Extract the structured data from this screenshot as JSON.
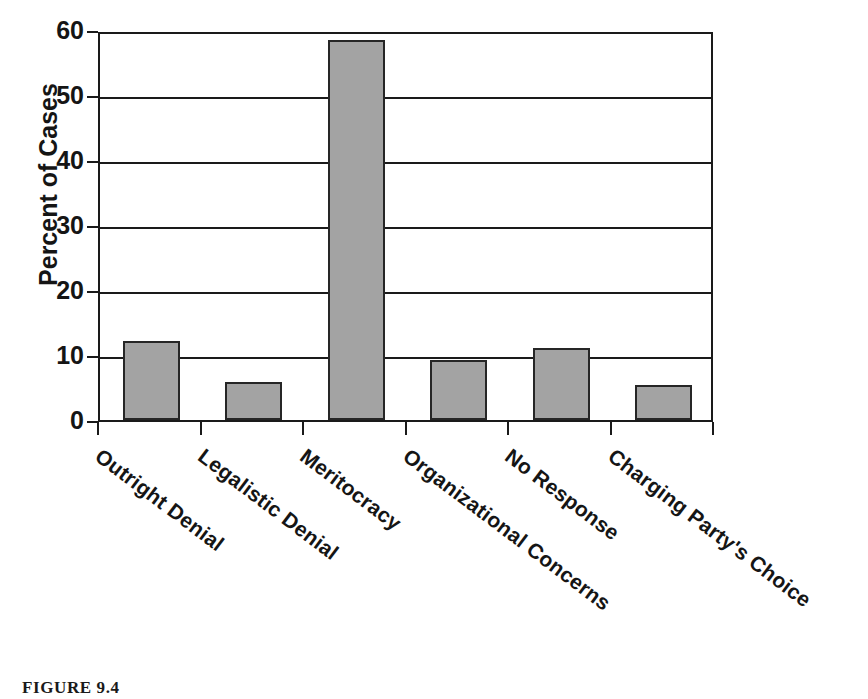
{
  "chart_data": {
    "type": "bar",
    "title": "",
    "xlabel": "",
    "ylabel": "Percent of Cases",
    "ylim": [
      0,
      60
    ],
    "yticks": [
      0,
      10,
      20,
      30,
      40,
      50,
      60
    ],
    "grid": true,
    "legend": "none",
    "categories": [
      "Outright Denial",
      "Legalistic Denial",
      "Meritocracy",
      "Organizational Concerns",
      "No Response",
      "Charging Party's Choice"
    ],
    "values": [
      12.2,
      5.9,
      58.5,
      9.3,
      11.1,
      5.4
    ],
    "bar_color": "#a3a3a3",
    "bar_edge_color": "#262626"
  },
  "axis": {
    "y_title": "Percent of Cases",
    "tick_labels": [
      "60",
      "50",
      "40",
      "30",
      "20",
      "10",
      "0"
    ]
  },
  "caption": {
    "text": "FIGURE 9.4"
  }
}
